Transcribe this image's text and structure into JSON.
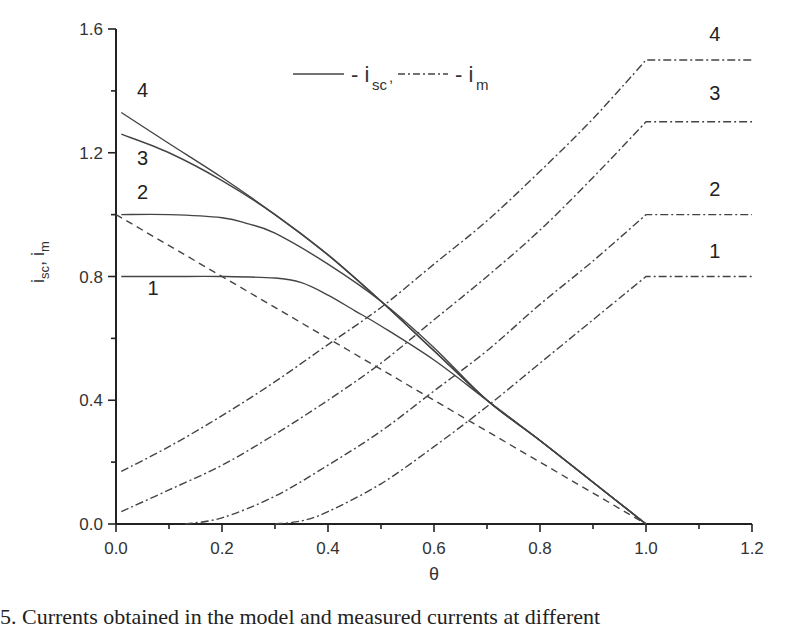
{
  "chart_data": {
    "type": "line",
    "title": "",
    "xlabel": "θ",
    "ylabel": "i_sc, i_m",
    "xlim": [
      0.0,
      1.2
    ],
    "ylim": [
      0.0,
      1.6
    ],
    "x_ticks": [
      "0.0",
      "0.2",
      "0.4",
      "0.6",
      "0.8",
      "1.0",
      "1.2"
    ],
    "y_ticks": [
      "0.0",
      "0.4",
      "0.8",
      "1.2",
      "1.6"
    ],
    "grid": false,
    "legend": {
      "position": "top-center",
      "entries": [
        {
          "style": "solid",
          "label": "- i_sc,"
        },
        {
          "style": "dash-dot",
          "label": "- i_m"
        }
      ]
    },
    "series": [
      {
        "name": "i_sc 1",
        "style": "solid",
        "label": "1",
        "x": [
          0.01,
          0.1,
          0.2,
          0.3,
          0.35,
          0.4,
          0.45,
          0.5,
          0.6,
          0.7,
          0.8,
          0.9,
          1.0
        ],
        "values": [
          0.8,
          0.8,
          0.8,
          0.795,
          0.78,
          0.74,
          0.69,
          0.64,
          0.53,
          0.4,
          0.27,
          0.135,
          0.0
        ]
      },
      {
        "name": "i_sc 2",
        "style": "solid",
        "label": "2",
        "x": [
          0.01,
          0.1,
          0.2,
          0.25,
          0.3,
          0.4,
          0.5,
          0.6,
          0.7,
          0.8,
          0.9,
          1.0
        ],
        "values": [
          1.0,
          1.0,
          0.99,
          0.97,
          0.94,
          0.84,
          0.72,
          0.57,
          0.4,
          0.27,
          0.135,
          0.0
        ]
      },
      {
        "name": "i_sc 3",
        "style": "solid",
        "label": "3",
        "x": [
          0.01,
          0.1,
          0.2,
          0.3,
          0.4,
          0.5,
          0.6,
          0.7,
          0.8,
          0.9,
          1.0
        ],
        "values": [
          1.26,
          1.2,
          1.11,
          1.0,
          0.87,
          0.72,
          0.56,
          0.4,
          0.27,
          0.135,
          0.0
        ]
      },
      {
        "name": "i_sc 4",
        "style": "solid",
        "label": "4",
        "x": [
          0.01,
          0.1,
          0.2,
          0.3,
          0.4,
          0.5,
          0.6,
          0.7,
          0.8,
          0.9,
          1.0
        ],
        "values": [
          1.33,
          1.23,
          1.12,
          1.0,
          0.87,
          0.72,
          0.56,
          0.4,
          0.27,
          0.135,
          0.0
        ]
      },
      {
        "name": "reference",
        "style": "dashed",
        "x": [
          0.0,
          1.0
        ],
        "values": [
          1.0,
          0.0
        ]
      },
      {
        "name": "i_m 1",
        "style": "dash-dot",
        "label": "1",
        "x": [
          0.3,
          0.35,
          0.4,
          0.5,
          0.6,
          0.7,
          0.8,
          0.9,
          1.0,
          1.2
        ],
        "values": [
          0.0,
          0.01,
          0.04,
          0.13,
          0.25,
          0.38,
          0.52,
          0.66,
          0.8,
          0.8
        ]
      },
      {
        "name": "i_m 2",
        "style": "dash-dot",
        "label": "2",
        "x": [
          0.13,
          0.2,
          0.3,
          0.4,
          0.5,
          0.6,
          0.7,
          0.8,
          0.9,
          1.0,
          1.2
        ],
        "values": [
          0.0,
          0.02,
          0.09,
          0.19,
          0.3,
          0.43,
          0.56,
          0.71,
          0.85,
          1.0,
          1.0
        ]
      },
      {
        "name": "i_m 3",
        "style": "dash-dot",
        "label": "3",
        "x": [
          0.01,
          0.1,
          0.2,
          0.3,
          0.4,
          0.5,
          0.6,
          0.7,
          0.8,
          0.9,
          1.0,
          1.2
        ],
        "values": [
          0.04,
          0.11,
          0.19,
          0.29,
          0.4,
          0.52,
          0.66,
          0.8,
          0.95,
          1.12,
          1.3,
          1.3
        ]
      },
      {
        "name": "i_m 4",
        "style": "dash-dot",
        "label": "4",
        "x": [
          0.01,
          0.1,
          0.2,
          0.3,
          0.4,
          0.5,
          0.6,
          0.7,
          0.8,
          0.9,
          1.0,
          1.2
        ],
        "values": [
          0.17,
          0.25,
          0.35,
          0.46,
          0.58,
          0.7,
          0.84,
          0.98,
          1.14,
          1.31,
          1.5,
          1.5
        ]
      }
    ],
    "annotations": [
      {
        "text": "4",
        "x": 0.05,
        "y": 1.38
      },
      {
        "text": "3",
        "x": 0.05,
        "y": 1.16
      },
      {
        "text": "2",
        "x": 0.05,
        "y": 1.05
      },
      {
        "text": "1",
        "x": 0.07,
        "y": 0.74
      },
      {
        "text": "4",
        "x": 1.13,
        "y": 1.56
      },
      {
        "text": "3",
        "x": 1.13,
        "y": 1.37
      },
      {
        "text": "2",
        "x": 1.13,
        "y": 1.06
      },
      {
        "text": "1",
        "x": 1.13,
        "y": 0.86
      }
    ]
  },
  "caption": "5.   Currents obtained  in  the  model  and  measured  currents  at  different"
}
